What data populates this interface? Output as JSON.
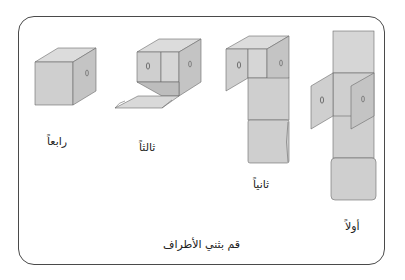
{
  "figure": {
    "caption": "قم بثني الأطراف",
    "steps": [
      {
        "order": 1,
        "label": "أولاً"
      },
      {
        "order": 2,
        "label": "ثانياً"
      },
      {
        "order": 3,
        "label": "ثالثاً"
      },
      {
        "order": 4,
        "label": "رابعاً"
      }
    ],
    "colors": {
      "face": "#cfcfcf",
      "face_light": "#dcdcdc",
      "face_dark": "#bdbdbd",
      "edge": "#6a6a6a",
      "frame": "#4a4a4a",
      "background": "#ffffff"
    }
  }
}
